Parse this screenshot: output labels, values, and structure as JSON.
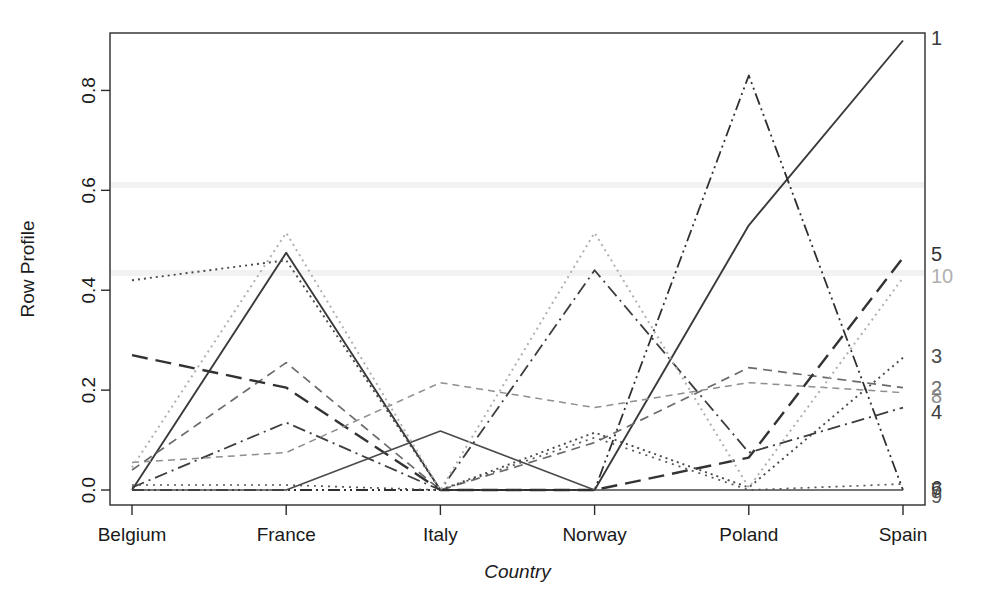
{
  "chart_data": {
    "type": "line",
    "title": "",
    "xlabel": "Country",
    "ylabel": "Row Profile",
    "categories": [
      "Belgium",
      "France",
      "Italy",
      "Norway",
      "Poland",
      "Spain"
    ],
    "x_tick_labels": [
      "Belgium",
      "France",
      "Italy",
      "Norway",
      "Poland",
      "Spain"
    ],
    "y_tick_labels": [
      "0.0",
      "0.2",
      "0.4",
      "0.6",
      "0.8"
    ],
    "y_tick_values": [
      0.0,
      0.2,
      0.4,
      0.6,
      0.8
    ],
    "ylim": [
      -0.03,
      0.915
    ],
    "grid": false,
    "legend": "right-edge-inline-labels",
    "series": [
      {
        "name": "1",
        "label": "1",
        "values": [
          0.0,
          0.475,
          0.0,
          0.0,
          0.53,
          0.9
        ],
        "style": "solid",
        "color": "#3a3a3a",
        "width": 1.9,
        "dash": "none",
        "label_y": 0.905
      },
      {
        "name": "2",
        "label": "2",
        "values": [
          0.04,
          0.255,
          0.0,
          0.095,
          0.245,
          0.205
        ],
        "style": "dashed",
        "color": "#6b6b6b",
        "width": 1.7,
        "dash": "9,6",
        "label_y": 0.205
      },
      {
        "name": "3",
        "label": "3",
        "values": [
          0.42,
          0.46,
          0.0,
          0.115,
          0.005,
          0.265
        ],
        "style": "dotted",
        "color": "#4a4a4a",
        "width": 1.9,
        "dash": "2,4",
        "label_y": 0.268
      },
      {
        "name": "4",
        "label": "4",
        "values": [
          0.005,
          0.135,
          0.0,
          0.44,
          0.075,
          0.165
        ],
        "style": "dash-dot",
        "color": "#3d3d3d",
        "width": 1.8,
        "dash": "13,5,2,5",
        "label_y": 0.157
      },
      {
        "name": "5",
        "label": "5",
        "values": [
          0.27,
          0.205,
          0.0,
          0.0,
          0.065,
          0.465
        ],
        "style": "long-dash",
        "color": "#333333",
        "width": 2.4,
        "dash": "16,8",
        "label_y": 0.472
      },
      {
        "name": "6",
        "label": "6",
        "values": [
          0.0,
          0.0,
          0.0,
          0.0,
          0.83,
          0.0
        ],
        "style": "dash-dot-dot",
        "color": "#2f2f2f",
        "width": 1.8,
        "dash": "12,4,2,4,2,4",
        "label_y": 0.005
      },
      {
        "name": "7",
        "label": "7",
        "values": [
          0.0,
          0.0,
          0.118,
          0.0,
          0.0,
          0.0
        ],
        "style": "solid",
        "color": "#4a4a4a",
        "width": 1.6,
        "dash": "none",
        "label_y": 0.0
      },
      {
        "name": "8",
        "label": "8",
        "values": [
          0.055,
          0.075,
          0.215,
          0.165,
          0.215,
          0.195
        ],
        "style": "dashed-fine",
        "color": "#8e8e8e",
        "width": 1.5,
        "dash": "7,5",
        "label_y": 0.188
      },
      {
        "name": "9",
        "label": "9",
        "values": [
          0.01,
          0.01,
          0.0,
          0.105,
          0.0,
          0.012
        ],
        "style": "dotted-fine",
        "color": "#565656",
        "width": 1.7,
        "dash": "2,5",
        "label_y": -0.012
      },
      {
        "name": "10",
        "label": "10",
        "values": [
          0.045,
          0.515,
          0.0,
          0.515,
          0.005,
          0.425
        ],
        "style": "dotted-light",
        "color": "#b0b0b0",
        "width": 2.0,
        "dash": "2,4",
        "label_y": 0.428
      }
    ]
  },
  "plot_geometry": {
    "left": 110,
    "right": 925,
    "top": 33,
    "bottom": 505
  },
  "figure": {
    "background": "#ffffff",
    "axis_color": "#2b2b2b",
    "text_color": "#1a1a1a"
  }
}
